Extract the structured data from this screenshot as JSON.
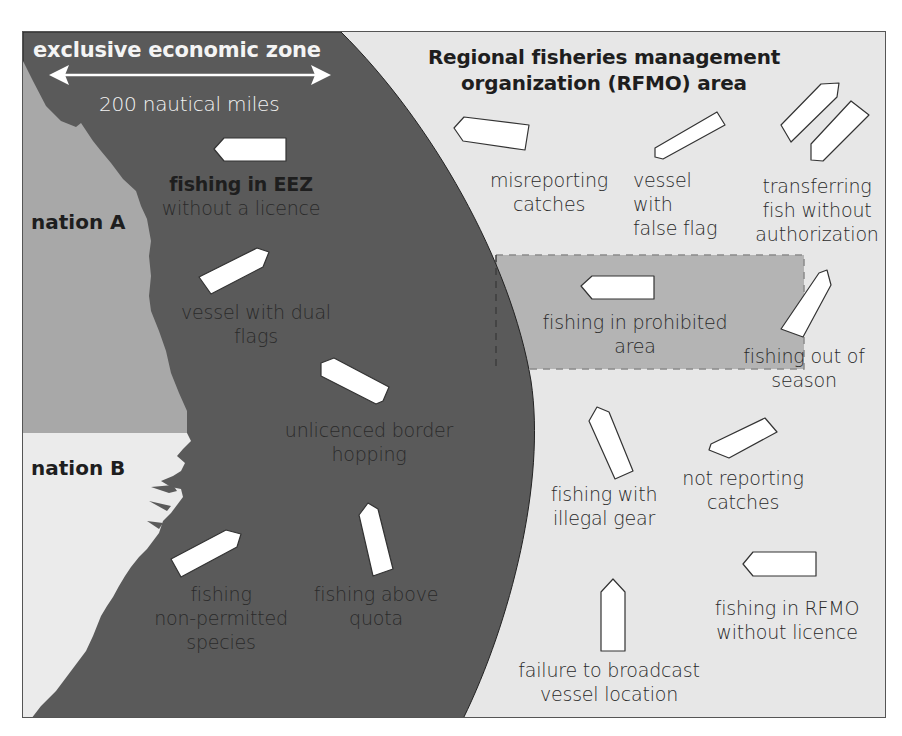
{
  "colors": {
    "eez": "#5a5a5a",
    "rfmo": "#e7e7e7",
    "nation_a": "#a8a8a8",
    "nation_b": "#ebebeb",
    "prohibited_area": "#b4b4b4",
    "vessel": "#ffffff",
    "border": "#555555"
  },
  "eez": {
    "title": "exclusive economic zone",
    "distance": "200 nautical miles"
  },
  "rfmo": {
    "title_line1": "Regional fisheries management",
    "title_line2": "organization (RFMO) area"
  },
  "nations": {
    "a": "nation A",
    "b": "nation B"
  },
  "eez_activities": {
    "no_licence": {
      "line1": "fishing in EEZ",
      "line2": "without a licence"
    },
    "dual_flags": {
      "line1": "vessel with dual",
      "line2": "flags"
    },
    "border_hopping": {
      "line1": "unlicenced border",
      "line2": "hopping"
    },
    "non_permitted": {
      "line1": "fishing",
      "line2": "non-permitted",
      "line3": "species"
    },
    "above_quota": {
      "line1": "fishing above",
      "line2": "quota"
    }
  },
  "rfmo_activities": {
    "misreporting": {
      "line1": "misreporting",
      "line2": "catches"
    },
    "false_flag": {
      "line1": "vessel",
      "line2": "with",
      "line3": "false flag"
    },
    "transferring": {
      "line1": "transferring",
      "line2": "fish without",
      "line3": "authorization"
    },
    "prohibited_area": {
      "line1": "fishing in prohibited",
      "line2": "area"
    },
    "out_of_season": {
      "line1": "fishing out of",
      "line2": "season"
    },
    "illegal_gear": {
      "line1": "fishing with",
      "line2": "illegal gear"
    },
    "not_reporting": {
      "line1": "not reporting",
      "line2": "catches"
    },
    "rfmo_no_licence": {
      "line1": "fishing in RFMO",
      "line2": "without licence"
    },
    "no_broadcast": {
      "line1": "failure to broadcast",
      "line2": "vessel location"
    }
  }
}
